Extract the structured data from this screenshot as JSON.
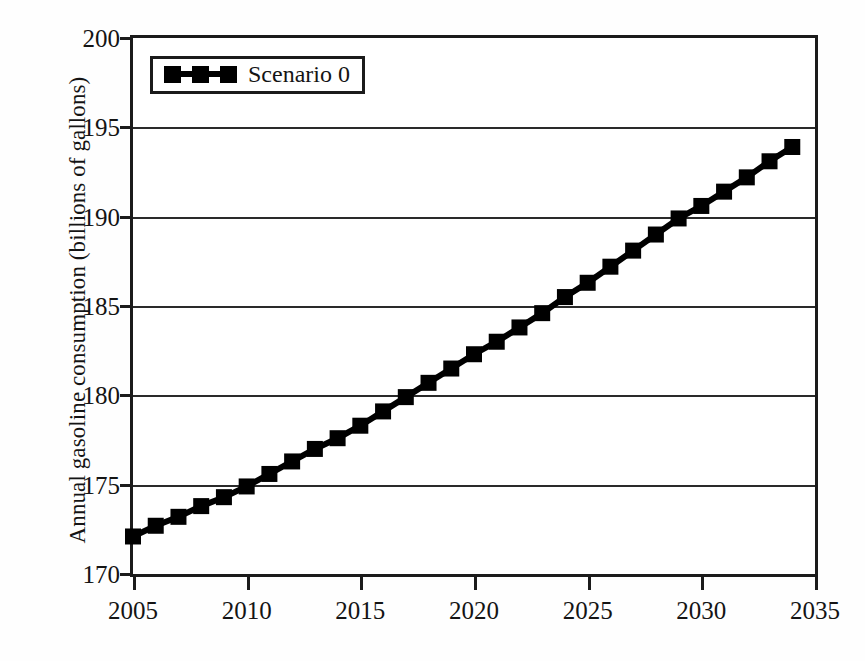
{
  "chart_data": {
    "type": "line",
    "title": "",
    "subtitle": "",
    "xlabel": "",
    "ylabel": "Annual gasoline consumption (billions of gallons)",
    "xlim": [
      2005,
      2035
    ],
    "ylim": [
      170,
      200
    ],
    "xticks": [
      2005,
      2010,
      2015,
      2020,
      2025,
      2030,
      2035
    ],
    "yticks": [
      170,
      175,
      180,
      185,
      190,
      195,
      200
    ],
    "grid": "horizontal",
    "legend_position": "top-left",
    "marker": "square",
    "line_color": "#000000",
    "marker_color": "#000000",
    "series": [
      {
        "name": "Scenario 0",
        "x": [
          2005,
          2006,
          2007,
          2008,
          2009,
          2010,
          2011,
          2012,
          2013,
          2014,
          2015,
          2016,
          2017,
          2018,
          2019,
          2020,
          2021,
          2022,
          2023,
          2024,
          2025,
          2026,
          2027,
          2028,
          2029,
          2030,
          2031,
          2032,
          2033,
          2034
        ],
        "values": [
          172.1,
          172.7,
          173.2,
          173.8,
          174.3,
          174.9,
          175.6,
          176.3,
          177.0,
          177.6,
          178.3,
          179.1,
          179.9,
          180.7,
          181.5,
          182.3,
          183.0,
          183.8,
          184.6,
          185.5,
          186.3,
          187.2,
          188.1,
          189.0,
          189.9,
          190.6,
          191.4,
          192.2,
          193.1,
          193.9
        ]
      }
    ]
  },
  "legend": {
    "entries": [
      {
        "label": "Scenario 0",
        "marker": "square",
        "color": "#000000"
      }
    ]
  },
  "axes": {
    "y_title": "Annual gasoline consumption (billions of gallons)",
    "y_tick_labels": [
      "200",
      "195",
      "190",
      "185",
      "180",
      "175",
      "170"
    ],
    "x_tick_labels": [
      "2005",
      "2010",
      "2015",
      "2020",
      "2025",
      "2030",
      "2035"
    ]
  }
}
